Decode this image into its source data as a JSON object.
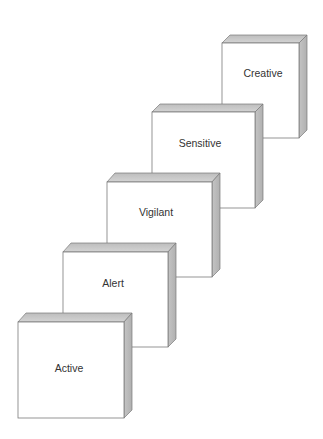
{
  "diagram": {
    "type": "stacked-3d-steps",
    "colors": {
      "face": "#ffffff",
      "border": "#7a7a7a",
      "top": "#c8c8c8",
      "side": "#bcbcbc",
      "connector": "#555555",
      "text": "#333333"
    },
    "boxes": [
      {
        "label": "Active"
      },
      {
        "label": "Alert"
      },
      {
        "label": "Vigilant"
      },
      {
        "label": "Sensitive"
      },
      {
        "label": "Creative"
      }
    ]
  }
}
